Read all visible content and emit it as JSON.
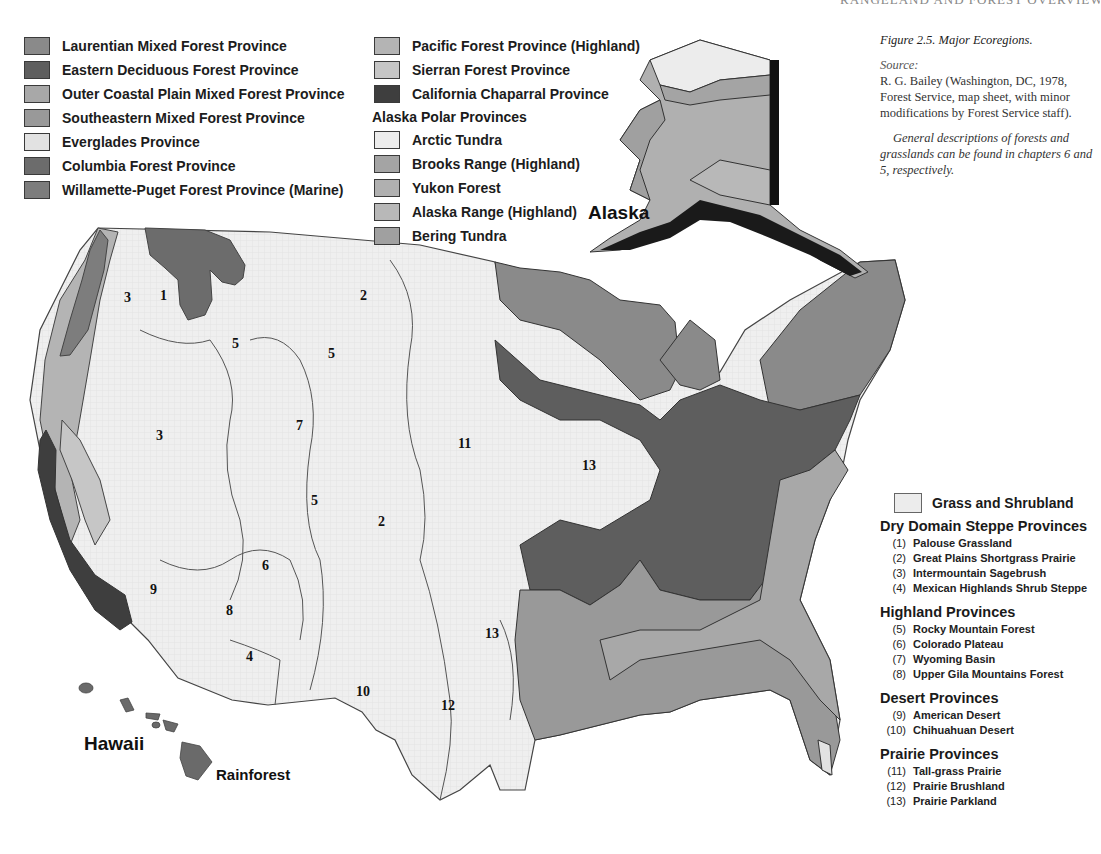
{
  "page": {
    "running_head": "RANGELAND AND FOREST OVERVIEW   5"
  },
  "figure": {
    "title": "Figure 2.5. Major Ecoregions.",
    "source_label": "Source:",
    "source_text": "R. G. Bailey (Washington, DC, 1978, Forest Service, map sheet, with minor modifications by Forest Service staff).",
    "note": "General descriptions of forests and grasslands can be found in chapters 6 and 5, respectively."
  },
  "legend_left": [
    {
      "label": "Laurentian Mixed Forest Province",
      "color": "#8a8a8a"
    },
    {
      "label": "Eastern Deciduous Forest Province",
      "color": "#5e5e5e"
    },
    {
      "label": "Outer Coastal Plain Mixed Forest Province",
      "color": "#a8a8a8"
    },
    {
      "label": "Southeastern Mixed Forest Province",
      "color": "#999999"
    },
    {
      "label": "Everglades Province",
      "color": "#e2e2e2"
    },
    {
      "label": "Columbia Forest Province",
      "color": "#6c6c6c"
    },
    {
      "label": "Willamette-Puget Forest Province (Marine)",
      "color": "#7d7d7d"
    }
  ],
  "legend_middle": {
    "items": [
      {
        "label": "Pacific Forest Province (Highland)",
        "color": "#b4b4b4"
      },
      {
        "label": "Sierran Forest Province",
        "color": "#c6c6c6"
      },
      {
        "label": "California Chaparral Province",
        "color": "#3e3e3e"
      }
    ],
    "alaska_heading": "Alaska Polar Provinces",
    "alaska_items": [
      {
        "label": "Arctic Tundra",
        "color": "#ececec"
      },
      {
        "label": "Brooks Range  (Highland)",
        "color": "#a4a4a4"
      },
      {
        "label": "Yukon Forest",
        "color": "#b0b0b0"
      },
      {
        "label": "Alaska Range (Highland)",
        "color": "#b8b8b8"
      },
      {
        "label": "Bering Tundra",
        "color": "#a0a0a0"
      }
    ]
  },
  "legend_right": {
    "grass_label": "Grass and Shrubland",
    "grass_color": "#ececec",
    "groups": [
      {
        "title": "Dry Domain Steppe Provinces",
        "items": [
          {
            "num": "(1)",
            "label": "Palouse Grassland"
          },
          {
            "num": "(2)",
            "label": "Great Plains Shortgrass Prairie"
          },
          {
            "num": "(3)",
            "label": "Intermountain Sagebrush"
          },
          {
            "num": "(4)",
            "label": "Mexican Highlands Shrub Steppe"
          }
        ]
      },
      {
        "title": "Highland Provinces",
        "items": [
          {
            "num": "(5)",
            "label": "Rocky Mountain Forest"
          },
          {
            "num": "(6)",
            "label": "Colorado Plateau"
          },
          {
            "num": "(7)",
            "label": "Wyoming Basin"
          },
          {
            "num": "(8)",
            "label": "Upper Gila Mountains Forest"
          }
        ]
      },
      {
        "title": "Desert Provinces",
        "items": [
          {
            "num": "(9)",
            "label": "American Desert"
          },
          {
            "num": "(10)",
            "label": "Chihuahuan Desert"
          }
        ]
      },
      {
        "title": "Prairie Provinces",
        "items": [
          {
            "num": "(11)",
            "label": "Tall-grass Prairie"
          },
          {
            "num": "(12)",
            "label": "Prairie Brushland"
          },
          {
            "num": "(13)",
            "label": "Prairie Parkland"
          }
        ]
      }
    ]
  },
  "map": {
    "alaska_label": "Alaska",
    "hawaii_label": "Hawaii",
    "rainforest_label": "Rainforest",
    "region_numbers": [
      {
        "n": "1",
        "x": 160,
        "y": 300
      },
      {
        "n": "3",
        "x": 124,
        "y": 302
      },
      {
        "n": "2",
        "x": 360,
        "y": 300
      },
      {
        "n": "5",
        "x": 232,
        "y": 348
      },
      {
        "n": "5",
        "x": 328,
        "y": 358
      },
      {
        "n": "3",
        "x": 156,
        "y": 440
      },
      {
        "n": "7",
        "x": 296,
        "y": 430
      },
      {
        "n": "11",
        "x": 458,
        "y": 448
      },
      {
        "n": "13",
        "x": 582,
        "y": 470
      },
      {
        "n": "5",
        "x": 311,
        "y": 505
      },
      {
        "n": "2",
        "x": 378,
        "y": 526
      },
      {
        "n": "6",
        "x": 262,
        "y": 570
      },
      {
        "n": "9",
        "x": 150,
        "y": 594
      },
      {
        "n": "8",
        "x": 226,
        "y": 615
      },
      {
        "n": "4",
        "x": 246,
        "y": 661
      },
      {
        "n": "13",
        "x": 485,
        "y": 638
      },
      {
        "n": "10",
        "x": 356,
        "y": 696
      },
      {
        "n": "12",
        "x": 441,
        "y": 710
      }
    ]
  }
}
